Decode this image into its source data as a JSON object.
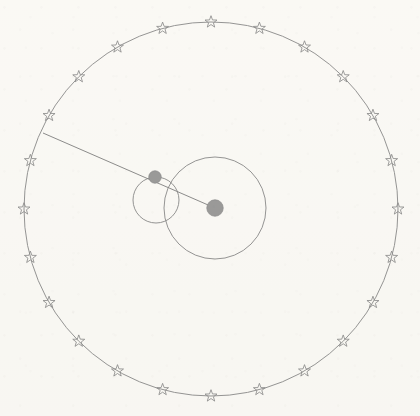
{
  "figure": {
    "caption": "",
    "background_color": "#fbfaf7",
    "stroke_color": "#8a8a8a",
    "body_fill_color": "#9b9b9b"
  },
  "canvas": {
    "width": 420,
    "height": 416
  },
  "circles": [
    {
      "name": "sphere-of-fixed-stars",
      "label": "Outer celestial sphere",
      "cx": 211,
      "cy": 209,
      "r": 187,
      "stroke": "#8a8a8a",
      "stroke_width": 0.9
    },
    {
      "name": "deferent",
      "label": "Deferent circle",
      "cx": 215,
      "cy": 208,
      "r": 51,
      "stroke": "#8a8a8a",
      "stroke_width": 0.9
    },
    {
      "name": "epicycle",
      "label": "Epicycle circle",
      "cx": 156,
      "cy": 200,
      "r": 23,
      "stroke": "#8a8a8a",
      "stroke_width": 0.9
    }
  ],
  "bodies": [
    {
      "name": "central-body",
      "label": "Central body",
      "cx": 215,
      "cy": 208,
      "r": 8.2,
      "fill": "#9b9b9b"
    },
    {
      "name": "orbiting-body",
      "label": "Orbiting body on epicycle",
      "cx": 155,
      "cy": 177,
      "r": 6.2,
      "fill": "#9b9b9b"
    }
  ],
  "radius_line": {
    "name": "sight-line",
    "label": "Line of sight to fixed star",
    "x1": 215,
    "y1": 208,
    "x2": 43,
    "y2": 133,
    "stroke": "#808080",
    "stroke_width": 0.9
  },
  "stars": {
    "count": 24,
    "spacing_degrees": 15,
    "start_angle_degrees": -90,
    "outer_radius_px": 6.3,
    "inner_radius_px": 2.55,
    "points": 5,
    "center": {
      "cx": 211,
      "cy": 209,
      "r": 187
    },
    "positions_degrees": [
      -90,
      -75,
      -60,
      -45,
      -30,
      -15,
      0,
      15,
      30,
      45,
      60,
      75,
      90,
      105,
      120,
      135,
      150,
      165,
      180,
      195,
      210,
      225,
      240,
      255
    ]
  },
  "chart_data": {
    "type": "scatter",
    "xlabel": "",
    "ylabel": "",
    "xlim": [
      0,
      420
    ],
    "ylim": [
      0,
      416
    ],
    "grid": false,
    "legend": "none",
    "series": [
      {
        "name": "sphere-of-fixed-stars",
        "kind": "circle",
        "center": [
          211,
          209
        ],
        "radius": 187
      },
      {
        "name": "deferent",
        "kind": "circle",
        "center": [
          215,
          208
        ],
        "radius": 51
      },
      {
        "name": "epicycle",
        "kind": "circle",
        "center": [
          156,
          200
        ],
        "radius": 23
      },
      {
        "name": "central-body",
        "kind": "point",
        "center": [
          215,
          208
        ],
        "radius": 8.2
      },
      {
        "name": "orbiting-body",
        "kind": "point",
        "center": [
          155,
          177
        ],
        "radius": 6.2
      },
      {
        "name": "sight-line",
        "kind": "segment",
        "x": [
          215,
          43
        ],
        "y": [
          208,
          133
        ]
      },
      {
        "name": "fixed-stars",
        "kind": "markers",
        "marker": "star5-outline",
        "count": 24,
        "angles_degrees": [
          -90,
          -75,
          -60,
          -45,
          -30,
          -15,
          0,
          15,
          30,
          45,
          60,
          75,
          90,
          105,
          120,
          135,
          150,
          165,
          180,
          195,
          210,
          225,
          240,
          255
        ],
        "ring_center": [
          211,
          209
        ],
        "ring_radius": 187
      }
    ]
  }
}
